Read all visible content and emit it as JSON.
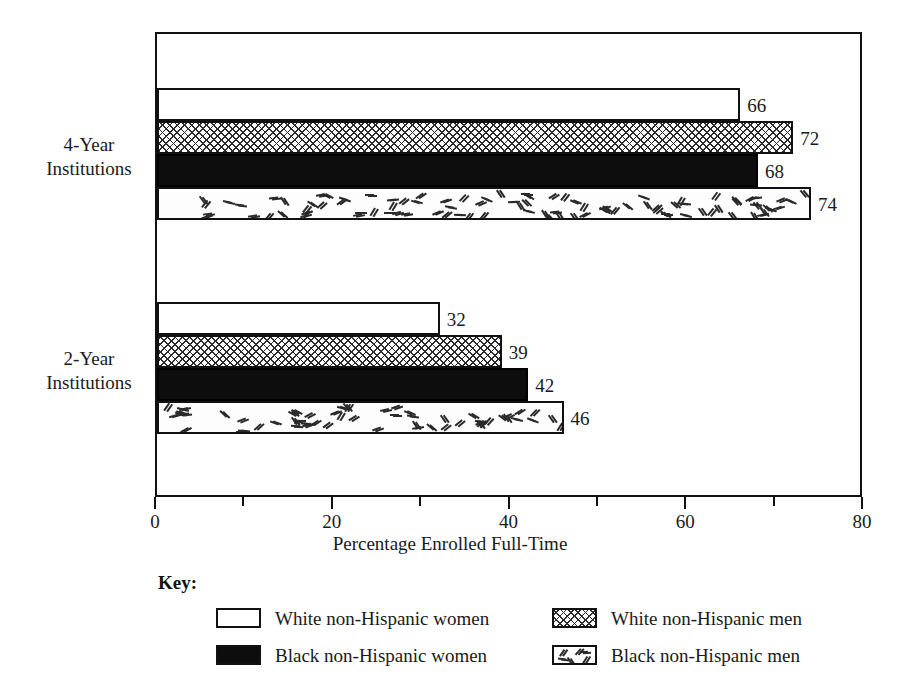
{
  "chart_data": {
    "type": "bar",
    "orientation": "horizontal",
    "title": "",
    "xlabel": "Percentage Enrolled Full-Time",
    "ylabel": "",
    "xlim": [
      0,
      80
    ],
    "xticks": [
      0,
      20,
      40,
      60,
      80
    ],
    "xtick_labels": [
      "0",
      "20",
      "40",
      "60",
      "80"
    ],
    "minor_xticks": [
      10,
      30,
      50,
      70
    ],
    "grid": false,
    "legend_position": "below",
    "categories": [
      "4-Year Institutions",
      "2-Year Institutions"
    ],
    "series": [
      {
        "name": "White non-Hispanic women",
        "pattern": "solid-white",
        "values": [
          66,
          32
        ]
      },
      {
        "name": "White non-Hispanic men",
        "pattern": "crosshatch",
        "values": [
          72,
          39
        ]
      },
      {
        "name": "Black non-Hispanic women",
        "pattern": "black",
        "values": [
          68,
          42
        ]
      },
      {
        "name": "Black non-Hispanic men",
        "pattern": "dashes",
        "values": [
          74,
          46
        ]
      }
    ]
  },
  "axis": {
    "x_title": "Percentage Enrolled Full-Time",
    "tick_labels": [
      "0",
      "20",
      "40",
      "60",
      "80"
    ]
  },
  "categories": [
    {
      "line1": "4-Year",
      "line2": "Institutions"
    },
    {
      "line1": "2-Year",
      "line2": "Institutions"
    }
  ],
  "bars": {
    "group_4year": [
      {
        "series": "White non-Hispanic women",
        "pattern": "solid-white",
        "value": 66,
        "label": "66"
      },
      {
        "series": "White non-Hispanic men",
        "pattern": "crosshatch",
        "value": 72,
        "label": "72"
      },
      {
        "series": "Black non-Hispanic women",
        "pattern": "black",
        "value": 68,
        "label": "68"
      },
      {
        "series": "Black non-Hispanic men",
        "pattern": "dashes",
        "value": 74,
        "label": "74"
      }
    ],
    "group_2year": [
      {
        "series": "White non-Hispanic women",
        "pattern": "solid-white",
        "value": 32,
        "label": "32"
      },
      {
        "series": "White non-Hispanic men",
        "pattern": "crosshatch",
        "value": 39,
        "label": "39"
      },
      {
        "series": "Black non-Hispanic women",
        "pattern": "black",
        "value": 42,
        "label": "42"
      },
      {
        "series": "Black non-Hispanic men",
        "pattern": "dashes",
        "value": 46,
        "label": "46"
      }
    ]
  },
  "key": {
    "title": "Key:",
    "items": [
      {
        "pattern": "solid-white",
        "label": "White non-Hispanic women",
        "column": "left"
      },
      {
        "pattern": "black",
        "label": "Black non-Hispanic women",
        "column": "left"
      },
      {
        "pattern": "crosshatch",
        "label": "White non-Hispanic men",
        "column": "right"
      },
      {
        "pattern": "dashes",
        "label": "Black non-Hispanic men",
        "column": "right"
      }
    ]
  },
  "colors": {
    "ink": "#111111",
    "fill_black": "#0d0d0d",
    "fill_white": "#ffffff",
    "pattern_stroke": "#2b2b2b",
    "background": "#ffffff"
  }
}
